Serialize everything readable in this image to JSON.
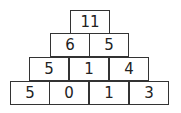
{
  "pyramid": {
    "rows": [
      [
        "11"
      ],
      [
        "6",
        "5"
      ],
      [
        "5",
        "1",
        "4"
      ],
      [
        "5",
        "0",
        "1",
        "3"
      ]
    ]
  }
}
